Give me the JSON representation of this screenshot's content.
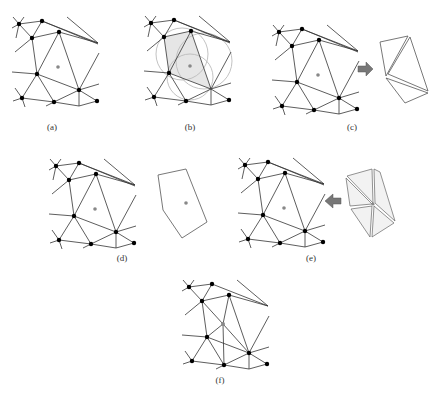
{
  "figure": {
    "panels": [
      {
        "id": "a",
        "label": "(a)",
        "offset": [
          0,
          0
        ],
        "description": "Initial triangulation with new point inserted"
      },
      {
        "id": "b",
        "label": "(b)",
        "offset": [
          132,
          -1
        ],
        "description": "Circumcircles containing the new point identify cavity triangles"
      },
      {
        "id": "c",
        "label": "(c)",
        "offset": [
          260,
          8
        ],
        "description": "Cavity triangles removed"
      },
      {
        "id": "d",
        "label": "(d)",
        "offset": [
          37,
          142
        ],
        "description": "Cavity polygon boundary"
      },
      {
        "id": "e",
        "label": "(e)",
        "offset": [
          226,
          141
        ],
        "description": "New triangles formed by connecting point to cavity boundary"
      },
      {
        "id": "f",
        "label": "(f)",
        "offset": [
          170,
          263
        ],
        "description": "Updated triangulation"
      }
    ],
    "colors": {
      "edge": "#333333",
      "node": "#000000",
      "new_point": "#888888",
      "cavity_fill": "#e6e6e6",
      "circle": "#bbbbbb",
      "arrow": "#777777"
    }
  }
}
